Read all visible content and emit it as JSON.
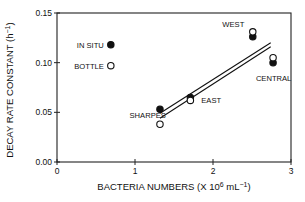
{
  "chart_data": {
    "type": "scatter",
    "title": "",
    "xlabel": "BACTERIA NUMBERS (X 10",
    "xlabel_sup": "6",
    "xlabel_tail": " mL",
    "xlabel_sup2": "−1",
    "xlabel_close": ")",
    "ylabel": "DECAY RATE CONSTANT (h",
    "ylabel_sup": "−1",
    "ylabel_close": ")",
    "xlim": [
      0,
      3
    ],
    "ylim": [
      0.0,
      0.15
    ],
    "x_ticks": [
      0,
      1,
      2,
      3
    ],
    "x_tick_labels": [
      "0",
      "1",
      "2",
      "3"
    ],
    "y_ticks": [
      0.0,
      0.05,
      0.1,
      0.15
    ],
    "y_tick_labels": [
      "0.00",
      "0.05",
      "0.10",
      "0.15"
    ],
    "grid": false,
    "legend": {
      "position": "upper-left-inside",
      "entries": [
        {
          "label": "IN SITU",
          "marker": "filled-circle",
          "x": 0.69,
          "y": 0.118
        },
        {
          "label": "BOTTLE",
          "marker": "open-circle",
          "x": 0.69,
          "y": 0.097
        }
      ]
    },
    "series": [
      {
        "name": "IN SITU",
        "marker": "filled-circle",
        "points": [
          {
            "site": "SHARPES",
            "x": 1.32,
            "y": 0.053
          },
          {
            "site": "EAST",
            "x": 1.71,
            "y": 0.065
          },
          {
            "site": "WEST",
            "x": 2.51,
            "y": 0.126
          },
          {
            "site": "CENTRAL",
            "x": 2.77,
            "y": 0.1
          }
        ],
        "regression": {
          "x_start": 1.32,
          "y_start": 0.049,
          "x_end": 2.74,
          "y_end": 0.12
        }
      },
      {
        "name": "BOTTLE",
        "marker": "open-circle",
        "points": [
          {
            "site": "SHARPES",
            "x": 1.32,
            "y": 0.038
          },
          {
            "site": "EAST",
            "x": 1.71,
            "y": 0.062
          },
          {
            "site": "WEST",
            "x": 2.51,
            "y": 0.131
          },
          {
            "site": "CENTRAL",
            "x": 2.77,
            "y": 0.105
          }
        ],
        "regression": {
          "x_start": 1.32,
          "y_start": 0.044,
          "x_end": 2.74,
          "y_end": 0.116
        }
      }
    ],
    "site_labels": [
      {
        "text": "SHARPES",
        "x": 0.93,
        "y": 0.044
      },
      {
        "text": "EAST",
        "x": 1.85,
        "y": 0.059
      },
      {
        "text": "WEST",
        "x": 2.12,
        "y": 0.136
      },
      {
        "text": "CENTRAL",
        "x": 2.55,
        "y": 0.082
      }
    ]
  }
}
